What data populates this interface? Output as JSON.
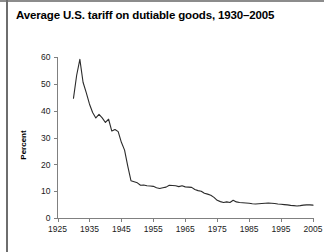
{
  "figure": {
    "title": "Average U.S. tariff on dutiable goods, 1930–2005",
    "background_color": "#ffffff",
    "line_color": "#2b2b2b",
    "axis_color": "#808080"
  },
  "chart_data": {
    "type": "line",
    "title": "Average U.S. tariff on dutiable goods, 1930–2005",
    "xlabel": "",
    "ylabel": "Percent",
    "xlim": [
      1925,
      2005
    ],
    "ylim": [
      0,
      60
    ],
    "xticks": [
      1925,
      1935,
      1945,
      1955,
      1965,
      1975,
      1985,
      1995,
      2005
    ],
    "yticks": [
      0,
      10,
      20,
      30,
      40,
      50,
      60
    ],
    "xtick_labels": [
      "1925",
      "1935",
      "1945",
      "1955",
      "1965",
      "1975",
      "1985",
      "1995",
      "2005"
    ],
    "ytick_labels": [
      "0",
      "10",
      "20",
      "30",
      "40",
      "50",
      "60"
    ],
    "grid": false,
    "legend": false,
    "series": [
      {
        "name": "Average U.S. tariff on dutiable goods",
        "x": [
          1930,
          1931,
          1932,
          1933,
          1934,
          1935,
          1936,
          1937,
          1938,
          1939,
          1940,
          1941,
          1942,
          1943,
          1944,
          1945,
          1946,
          1947,
          1948,
          1949,
          1950,
          1951,
          1952,
          1953,
          1954,
          1955,
          1956,
          1957,
          1958,
          1959,
          1960,
          1961,
          1962,
          1963,
          1964,
          1965,
          1966,
          1967,
          1968,
          1969,
          1970,
          1971,
          1972,
          1973,
          1974,
          1975,
          1976,
          1977,
          1978,
          1979,
          1980,
          1981,
          1982,
          1983,
          1984,
          1985,
          1986,
          1987,
          1988,
          1989,
          1990,
          1991,
          1992,
          1993,
          1994,
          1995,
          1996,
          1997,
          1998,
          1999,
          2000,
          2001,
          2002,
          2003,
          2004,
          2005
        ],
        "y": [
          44.6,
          53.2,
          59.1,
          50.6,
          46.7,
          42.5,
          39.3,
          37.3,
          38.6,
          37.3,
          35.6,
          36.8,
          32.4,
          33.0,
          32.2,
          28.2,
          25.3,
          19.3,
          13.9,
          13.5,
          13.1,
          12.2,
          12.3,
          12.0,
          11.9,
          11.8,
          11.3,
          11.0,
          11.3,
          11.5,
          12.2,
          12.1,
          12.0,
          11.7,
          12.0,
          11.6,
          11.5,
          11.4,
          10.6,
          10.2,
          10.0,
          9.2,
          8.9,
          8.5,
          7.7,
          6.6,
          6.1,
          5.8,
          6.0,
          5.8,
          6.6,
          6.0,
          5.8,
          5.7,
          5.6,
          5.5,
          5.3,
          5.2,
          5.3,
          5.4,
          5.5,
          5.6,
          5.5,
          5.4,
          5.2,
          5.1,
          5.0,
          4.9,
          4.7,
          4.6,
          4.5,
          4.6,
          4.8,
          4.9,
          4.9,
          4.8
        ]
      }
    ]
  }
}
